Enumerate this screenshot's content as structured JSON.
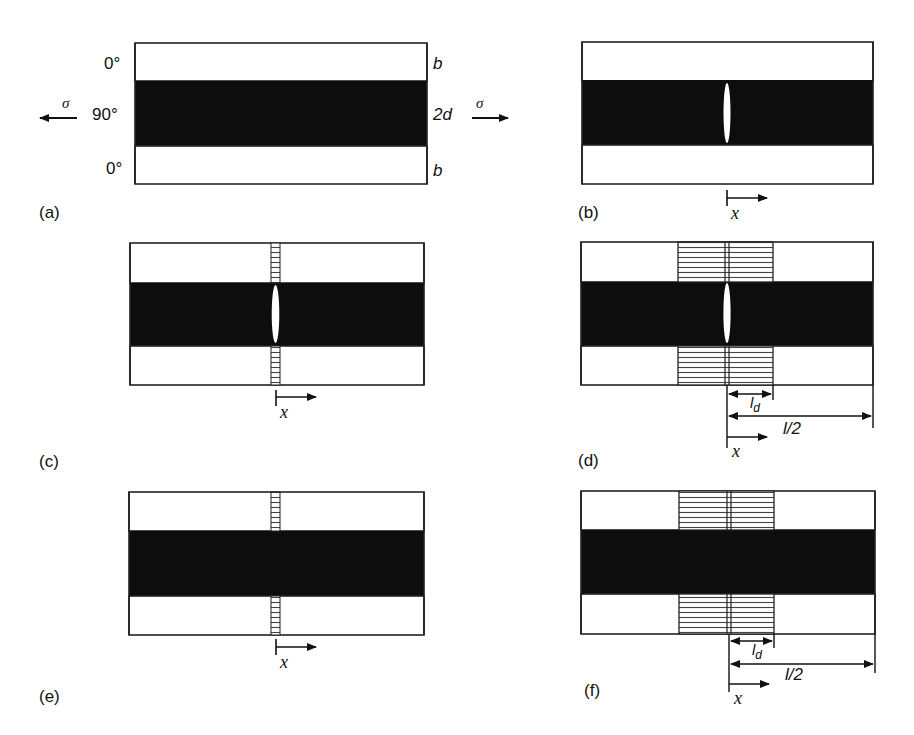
{
  "figure": {
    "colors": {
      "ply_0": "#ffffff",
      "ply_90": "#0d0d0d",
      "line": "#222222",
      "crack": "#ffffff"
    },
    "panel_a": {
      "label": "(a)",
      "ply_top": "0°",
      "ply_middle": "90°",
      "ply_bottom": "0°",
      "dim_top": "b",
      "dim_middle": "2d",
      "dim_bottom": "b",
      "stress_left": "σ",
      "stress_right": "σ"
    },
    "panel_b": {
      "label": "(b)",
      "x_label": "x",
      "features": [
        "transverse crack"
      ]
    },
    "panel_c": {
      "label": "(c)",
      "x_label": "x",
      "features": [
        "transverse crack",
        "narrow delamination zone"
      ]
    },
    "panel_d": {
      "label": "(d)",
      "x_label": "x",
      "ld_label": "l",
      "ld_sub": "d",
      "half_spacing_label": "l/2",
      "features": [
        "transverse crack",
        "wide delamination zone"
      ]
    },
    "panel_e": {
      "label": "(e)",
      "x_label": "x",
      "features": [
        "narrow delamination zone"
      ]
    },
    "panel_f": {
      "label": "(f)",
      "x_label": "x",
      "ld_label": "l",
      "ld_sub": "d",
      "half_spacing_label": "l/2",
      "features": [
        "wide delamination zone"
      ]
    }
  }
}
